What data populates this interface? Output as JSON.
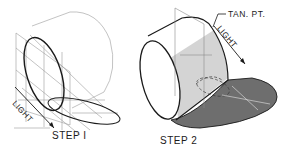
{
  "figure": {
    "step1": {
      "label": "STEP I",
      "light_label": "LIGHT"
    },
    "step2": {
      "label": "STEP 2",
      "light_label": "LIGHT",
      "tangent_label": "TAN. PT."
    }
  },
  "colors": {
    "line": "#1a1a1a",
    "thin_line": "#8a8a8a",
    "shade_light": "#d4d4d4",
    "shadow_dark": "#6e6e6e",
    "background": "#ffffff"
  }
}
